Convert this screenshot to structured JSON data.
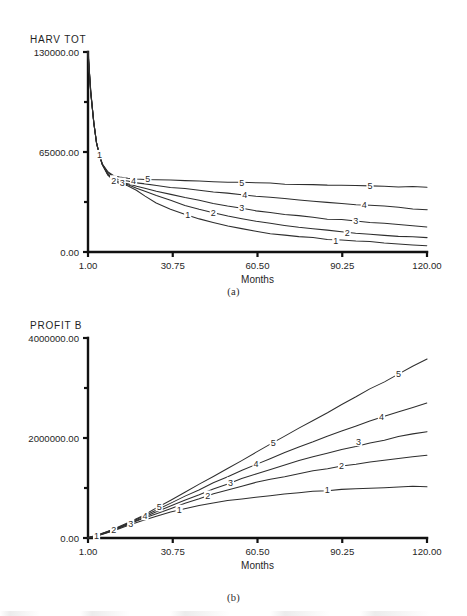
{
  "figure": {
    "panels": [
      {
        "id": "a",
        "caption": "(a)",
        "y_axis_name": "HARV TOT",
        "x_axis_label": "Months",
        "y_ticks": [
          "0.00",
          "65000.00",
          "130000.00"
        ],
        "x_ticks": [
          "1.00",
          "30.75",
          "60.50",
          "90.25",
          "120.00"
        ]
      },
      {
        "id": "b",
        "caption": "(b)",
        "y_axis_name": "PROFIT B",
        "x_axis_label": "Months",
        "y_ticks": [
          "0.00",
          "2000000.00",
          "4000000.00"
        ],
        "x_ticks": [
          "1.00",
          "30.75",
          "60.50",
          "90.25",
          "120.00"
        ]
      }
    ]
  },
  "chart_data": [
    {
      "type": "line",
      "panel": "a",
      "title": "HARV TOT",
      "xlabel": "Months",
      "ylabel": "HARV TOT",
      "xlim": [
        1.0,
        120.0
      ],
      "ylim": [
        0.0,
        130000.0
      ],
      "xticks": [
        1.0,
        30.75,
        60.5,
        90.25,
        120.0
      ],
      "yticks": [
        0.0,
        65000.0,
        130000.0
      ],
      "grid": false,
      "legend": "inline-curve-labels",
      "x": [
        1,
        2,
        3,
        4,
        5,
        6,
        8,
        10,
        12,
        15,
        18,
        21,
        25,
        30,
        35,
        40,
        45,
        50,
        55,
        60,
        65,
        70,
        75,
        80,
        85,
        90,
        95,
        100,
        105,
        110,
        115,
        120
      ],
      "series": [
        {
          "name": "1",
          "label": "1",
          "values": [
            130000,
            104000,
            84000,
            71000,
            63000,
            57000,
            50000,
            46500,
            44500,
            43000,
            40000,
            36500,
            32000,
            28000,
            24500,
            21500,
            19000,
            17000,
            15000,
            13500,
            12000,
            11000,
            10000,
            9200,
            8400,
            7800,
            7200,
            6600,
            6000,
            5400,
            4800,
            4200
          ]
        },
        {
          "name": "2",
          "label": "2",
          "values": [
            130000,
            104000,
            84000,
            71000,
            63000,
            57000,
            50500,
            47000,
            45000,
            43500,
            41500,
            39500,
            36500,
            33500,
            30500,
            28000,
            25500,
            23500,
            21500,
            20000,
            18500,
            17200,
            16000,
            15000,
            14000,
            13200,
            12400,
            11600,
            11000,
            10400,
            9800,
            9200
          ]
        },
        {
          "name": "3",
          "label": "3",
          "values": [
            130000,
            104000,
            84000,
            71000,
            63000,
            57000,
            51000,
            47500,
            45800,
            44500,
            43000,
            41500,
            39500,
            37500,
            35500,
            33500,
            31500,
            30000,
            28500,
            27000,
            25800,
            24600,
            23500,
            22500,
            21600,
            20800,
            20000,
            19200,
            18500,
            17800,
            17100,
            16400
          ]
        },
        {
          "name": "4",
          "label": "4",
          "values": [
            130000,
            104000,
            84000,
            71000,
            63000,
            57000,
            51500,
            48500,
            47000,
            46000,
            45000,
            44200,
            43200,
            42200,
            41200,
            40200,
            39200,
            38300,
            37400,
            36500,
            35600,
            34800,
            34000,
            33200,
            32400,
            31700,
            31000,
            30300,
            29600,
            28900,
            28200,
            27500
          ]
        },
        {
          "name": "5",
          "label": "5",
          "values": [
            130000,
            104000,
            84000,
            71000,
            63000,
            57000,
            52000,
            49500,
            48500,
            48000,
            47600,
            47300,
            47000,
            46700,
            46400,
            46100,
            45800,
            45500,
            45200,
            44900,
            44600,
            44300,
            44000,
            43700,
            43500,
            43300,
            43100,
            42900,
            42700,
            42500,
            42300,
            42100
          ]
        }
      ]
    },
    {
      "type": "line",
      "panel": "b",
      "title": "PROFIT B",
      "xlabel": "Months",
      "ylabel": "PROFIT B",
      "xlim": [
        1.0,
        120.0
      ],
      "ylim": [
        0.0,
        4000000.0
      ],
      "xticks": [
        1.0,
        30.75,
        60.5,
        90.25,
        120.0
      ],
      "yticks": [
        0.0,
        2000000.0,
        4000000.0
      ],
      "grid": false,
      "legend": "inline-curve-labels",
      "x": [
        1,
        5,
        10,
        15,
        20,
        25,
        30,
        35,
        40,
        45,
        50,
        55,
        60,
        65,
        70,
        75,
        80,
        85,
        90,
        95,
        100,
        105,
        110,
        115,
        120
      ],
      "series": [
        {
          "name": "1",
          "label": "1",
          "values": [
            0,
            60000,
            150000,
            250000,
            350000,
            440000,
            520000,
            590000,
            650000,
            700000,
            745000,
            785000,
            820000,
            852000,
            880000,
            905000,
            928000,
            948000,
            966000,
            982000,
            996000,
            1008000,
            1018000,
            1026000,
            1032000
          ]
        },
        {
          "name": "2",
          "label": "2",
          "values": [
            0,
            62000,
            158000,
            268000,
            380000,
            490000,
            596000,
            696000,
            790000,
            878000,
            960000,
            1036000,
            1106000,
            1172000,
            1233000,
            1290000,
            1342000,
            1390000,
            1435000,
            1477000,
            1516000,
            1552000,
            1586000,
            1618000,
            1648000
          ]
        },
        {
          "name": "3",
          "label": "3",
          "values": [
            0,
            64000,
            164000,
            280000,
            402000,
            524000,
            645000,
            762000,
            875000,
            984000,
            1088000,
            1188000,
            1283000,
            1374000,
            1461000,
            1544000,
            1623000,
            1698000,
            1770000,
            1838000,
            1903000,
            1965000,
            2024000,
            2080000,
            2134000
          ]
        },
        {
          "name": "4",
          "label": "4",
          "values": [
            0,
            66000,
            170000,
            292000,
            424000,
            560000,
            697000,
            833000,
            967000,
            1098000,
            1226000,
            1351000,
            1473000,
            1592000,
            1708000,
            1821000,
            1931000,
            2038000,
            2142000,
            2243000,
            2341000,
            2436000,
            2528000,
            2617000,
            2703000
          ]
        },
        {
          "name": "5",
          "label": "5",
          "values": [
            0,
            68000,
            176000,
            304000,
            446000,
            598000,
            754000,
            912000,
            1072000,
            1233000,
            1394000,
            1555000,
            1716000,
            1877000,
            2037000,
            2196000,
            2354000,
            2511000,
            2667000,
            2822000,
            2976000,
            3129000,
            3281000,
            3432000,
            3582000
          ]
        }
      ]
    }
  ],
  "curve_labels": {
    "panel_a": [
      {
        "series": "1",
        "x": 5,
        "y": 63000
      },
      {
        "series": "2",
        "x": 10,
        "y": 46500
      },
      {
        "series": "3",
        "x": 13,
        "y": 45000
      },
      {
        "series": "4",
        "x": 17,
        "y": 46500
      },
      {
        "series": "5",
        "x": 22,
        "y": 47300
      },
      {
        "series": "1",
        "x": 36,
        "y": 24000
      },
      {
        "series": "2",
        "x": 45,
        "y": 25500
      },
      {
        "series": "3",
        "x": 55,
        "y": 28500
      },
      {
        "series": "4",
        "x": 56,
        "y": 37200
      },
      {
        "series": "5",
        "x": 55,
        "y": 45200
      },
      {
        "series": "1",
        "x": 88,
        "y": 7500
      },
      {
        "series": "2",
        "x": 92,
        "y": 12800
      },
      {
        "series": "3",
        "x": 95,
        "y": 20000
      },
      {
        "series": "4",
        "x": 98,
        "y": 30600
      },
      {
        "series": "5",
        "x": 100,
        "y": 42900
      }
    ],
    "panel_b": [
      {
        "series": "1",
        "x": 4,
        "y": 45000
      },
      {
        "series": "2",
        "x": 10,
        "y": 158000
      },
      {
        "series": "3",
        "x": 16,
        "y": 290000
      },
      {
        "series": "4",
        "x": 21,
        "y": 440000
      },
      {
        "series": "5",
        "x": 26,
        "y": 620000
      },
      {
        "series": "1",
        "x": 33,
        "y": 560000
      },
      {
        "series": "2",
        "x": 43,
        "y": 845000
      },
      {
        "series": "3",
        "x": 51,
        "y": 1110000
      },
      {
        "series": "4",
        "x": 60,
        "y": 1480000
      },
      {
        "series": "5",
        "x": 66,
        "y": 1900000
      },
      {
        "series": "1",
        "x": 85,
        "y": 955000
      },
      {
        "series": "2",
        "x": 90,
        "y": 1450000
      },
      {
        "series": "3",
        "x": 96,
        "y": 1925000
      },
      {
        "series": "4",
        "x": 104,
        "y": 2430000
      },
      {
        "series": "5",
        "x": 110,
        "y": 3290000
      }
    ]
  }
}
